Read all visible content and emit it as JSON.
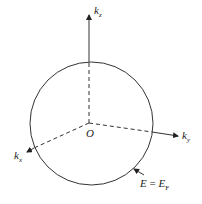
{
  "diagram": {
    "axes": {
      "kz": {
        "label": "k",
        "sub": "z"
      },
      "ky": {
        "label": "k",
        "sub": "y"
      },
      "kx": {
        "label": "k",
        "sub": "x"
      }
    },
    "origin_label": "O",
    "surface_label": {
      "lhs": "E",
      "eq": " = ",
      "rhs": "E",
      "rhs_sub": "F"
    }
  }
}
